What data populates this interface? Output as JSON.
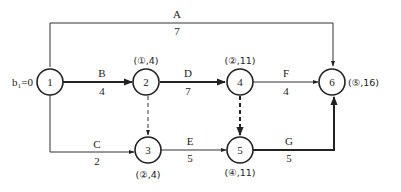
{
  "diagram": {
    "type": "activity-network",
    "start_label": "b₁=0",
    "nodes": [
      {
        "id": "1",
        "label": "1",
        "annotation": ""
      },
      {
        "id": "2",
        "label": "2",
        "annotation": "(①,4)"
      },
      {
        "id": "3",
        "label": "3",
        "annotation": "(②,4)"
      },
      {
        "id": "4",
        "label": "4",
        "annotation": "(②,11)"
      },
      {
        "id": "5",
        "label": "5",
        "annotation": "(④,11)"
      },
      {
        "id": "6",
        "label": "6",
        "annotation": "(⑤,16)"
      }
    ],
    "edges": [
      {
        "id": "A",
        "from": "1",
        "to": "6",
        "name": "A",
        "duration": "7",
        "style": "solid",
        "critical": false
      },
      {
        "id": "B",
        "from": "1",
        "to": "2",
        "name": "B",
        "duration": "4",
        "style": "solid",
        "critical": true
      },
      {
        "id": "C",
        "from": "1",
        "to": "3",
        "name": "C",
        "duration": "2",
        "style": "solid",
        "critical": false
      },
      {
        "id": "D",
        "from": "2",
        "to": "4",
        "name": "D",
        "duration": "7",
        "style": "solid",
        "critical": true
      },
      {
        "id": "E",
        "from": "3",
        "to": "5",
        "name": "E",
        "duration": "5",
        "style": "solid",
        "critical": false
      },
      {
        "id": "F",
        "from": "4",
        "to": "6",
        "name": "F",
        "duration": "4",
        "style": "solid",
        "critical": false
      },
      {
        "id": "G",
        "from": "5",
        "to": "6",
        "name": "G",
        "duration": "5",
        "style": "solid",
        "critical": true
      },
      {
        "id": "d23",
        "from": "2",
        "to": "3",
        "name": "",
        "duration": "",
        "style": "dashed",
        "critical": false
      },
      {
        "id": "d45",
        "from": "4",
        "to": "5",
        "name": "",
        "duration": "",
        "style": "dashed",
        "critical": true
      }
    ]
  }
}
